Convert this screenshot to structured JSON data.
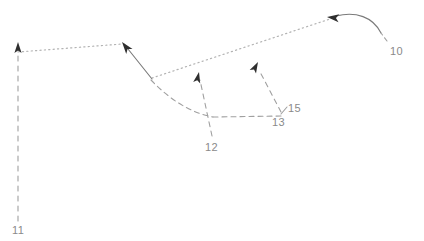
{
  "figure": {
    "type": "technical-annotation-diagram",
    "width": 424,
    "height": 241,
    "background_color": "#ffffff",
    "style": "hand-drawn patent-style leader lines with arrowheads"
  },
  "colors": {
    "dotted_path": "#b3b3b3",
    "dashed_leader": "#999999",
    "solid_stroke": "#6e6e6e",
    "arrowhead": "#333333",
    "label_text": "#8a8a8a"
  },
  "reference_labels": [
    {
      "id": "label-10",
      "text": "10",
      "x": 390,
      "y": 45
    },
    {
      "id": "label-11",
      "text": "11",
      "x": 12,
      "y": 224
    },
    {
      "id": "label-12",
      "text": "12",
      "x": 205,
      "y": 141
    },
    {
      "id": "label-13",
      "text": "13",
      "x": 272,
      "y": 116
    },
    {
      "id": "label-15",
      "text": "15",
      "x": 288,
      "y": 104
    }
  ],
  "paths": {
    "dotted_upper_left": {
      "name": "dotted-path-left-segment",
      "d": "M 18 52 L 122 44",
      "style": "dotted"
    },
    "dotted_upper_right": {
      "name": "dotted-path-right-segment",
      "d": "M 152 78 L 336 17",
      "style": "dotted"
    },
    "solid_diagonal": {
      "name": "solid-diagonal-stroke",
      "d": "M 152 79 L 123 43",
      "style": "solid"
    },
    "curve_right": {
      "name": "solid-curve-right",
      "d": "M 336 16 C 356 12, 372 17, 380 32",
      "style": "solid"
    },
    "dashed_curve_body": {
      "name": "dashed-curve-body",
      "d": "M 151 80 C 172 100, 192 113, 213 117",
      "style": "dashed"
    },
    "dashed_horizontal": {
      "name": "dashed-horizontal-segment",
      "d": "M 213 117 L 283 116",
      "style": "dashed"
    }
  },
  "leaders": [
    {
      "name": "leader-10",
      "label": "10",
      "d": "M 386 42 L 381 33",
      "style": "dashed"
    },
    {
      "name": "leader-11",
      "label": "11",
      "d": "M 18 221 L 18 50",
      "style": "dashed",
      "arrow": {
        "x": 18,
        "y": 42,
        "direction": "up"
      }
    },
    {
      "name": "leader-12",
      "label": "12",
      "d": "M 212 136 L 200 80",
      "style": "dashed",
      "arrow": {
        "x": 199,
        "y": 72,
        "direction": "up"
      }
    },
    {
      "name": "leader-13",
      "label": "13",
      "d": "M 281 112 L 259 70",
      "style": "dashed",
      "arrow": {
        "x": 258,
        "y": 62,
        "direction": "up-left"
      }
    },
    {
      "name": "leader-15",
      "label": "15",
      "d": "M 286 108 L 282 114",
      "style": "dashed"
    }
  ],
  "arrowheads": [
    {
      "name": "arrowhead-left-vertical",
      "x": 18,
      "y": 42,
      "angle": -90
    },
    {
      "name": "arrowhead-upper-mid",
      "x": 122,
      "y": 42,
      "angle": -52
    },
    {
      "name": "arrowhead-leader-12",
      "x": 199,
      "y": 72,
      "angle": -80
    },
    {
      "name": "arrowhead-leader-13",
      "x": 258,
      "y": 62,
      "angle": -64
    },
    {
      "name": "arrowhead-curve-left",
      "x": 327,
      "y": 17,
      "angle": 186
    }
  ]
}
